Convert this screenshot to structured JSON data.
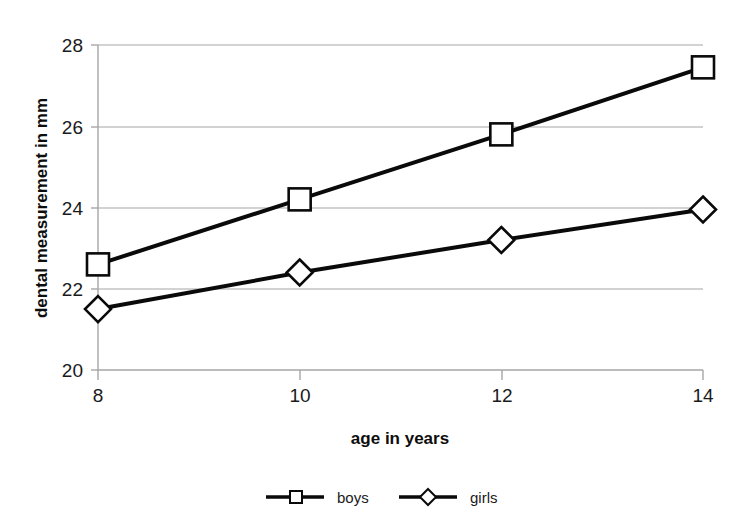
{
  "chart_data": {
    "type": "line",
    "title": "",
    "xlabel": "age in years",
    "ylabel": "dental measurement in mm",
    "x": [
      8,
      10,
      12,
      14
    ],
    "xtick_labels": [
      "8",
      "10",
      "12",
      "14"
    ],
    "ytick_labels": [
      "20",
      "22",
      "24",
      "26",
      "28"
    ],
    "yticks": [
      20,
      22,
      24,
      26,
      28
    ],
    "xlim": [
      8,
      14
    ],
    "ylim": [
      20,
      28
    ],
    "grid": "horizontal",
    "legend_position": "bottom",
    "series": [
      {
        "name": "boys",
        "marker": "square",
        "values": [
          22.6,
          24.2,
          25.8,
          27.45
        ]
      },
      {
        "name": "girls",
        "marker": "diamond",
        "values": [
          21.5,
          22.4,
          23.2,
          23.95
        ]
      }
    ]
  },
  "legend": {
    "items": [
      {
        "label": "boys",
        "marker": "square"
      },
      {
        "label": "girls",
        "marker": "diamond"
      }
    ]
  },
  "colors": {
    "series": "#0a0a0a",
    "grid": "#a6a6a6",
    "text": "#1a1a1a",
    "background": "#ffffff"
  }
}
